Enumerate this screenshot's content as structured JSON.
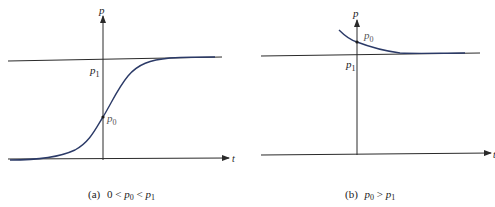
{
  "colors": {
    "axis": "#2a2a2a",
    "curve": "#2b3a67",
    "label": "#1c1c1c",
    "label_muted": "#555555"
  },
  "panel_a": {
    "y_axis_label": "p",
    "x_axis_label": "t",
    "equilibrium_label": "p",
    "equilibrium_sub": "1",
    "initial_label": "p",
    "initial_sub": "0",
    "caption_tag": "(a)",
    "caption_prefix": "0 <",
    "caption_p0": "p",
    "caption_p0_sub": "0",
    "caption_lt": "<",
    "caption_p1": "p",
    "caption_p1_sub": "1"
  },
  "panel_b": {
    "y_axis_label": "p",
    "x_axis_label": "t",
    "equilibrium_label": "p",
    "equilibrium_sub": "1",
    "initial_label": "p",
    "initial_sub": "0",
    "caption_tag": "(b)",
    "caption_p0": "p",
    "caption_p0_sub": "0",
    "caption_gt": ">",
    "caption_p1": "p",
    "caption_p1_sub": "1"
  }
}
